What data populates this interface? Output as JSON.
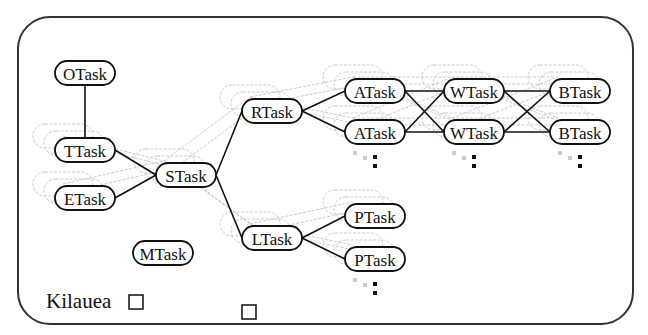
{
  "diagram": {
    "host_label": "Kilauea",
    "nodes": [
      {
        "id": "otask",
        "label": "OTask",
        "x": 85,
        "y": 73
      },
      {
        "id": "ttask",
        "label": "TTask",
        "x": 85,
        "y": 150
      },
      {
        "id": "etask",
        "label": "ETask",
        "x": 85,
        "y": 198
      },
      {
        "id": "stask",
        "label": "STask",
        "x": 186,
        "y": 175
      },
      {
        "id": "mtask",
        "label": "MTask",
        "x": 163,
        "y": 253
      },
      {
        "id": "rtask",
        "label": "RTask",
        "x": 272,
        "y": 111
      },
      {
        "id": "ltask",
        "label": "LTask",
        "x": 272,
        "y": 238
      },
      {
        "id": "atask1",
        "label": "ATask",
        "x": 375,
        "y": 91
      },
      {
        "id": "atask2",
        "label": "ATask",
        "x": 375,
        "y": 132
      },
      {
        "id": "wtask1",
        "label": "WTask",
        "x": 474,
        "y": 91
      },
      {
        "id": "wtask2",
        "label": "WTask",
        "x": 474,
        "y": 132
      },
      {
        "id": "btask1",
        "label": "BTask",
        "x": 580,
        "y": 91
      },
      {
        "id": "btask2",
        "label": "BTask",
        "x": 580,
        "y": 132
      },
      {
        "id": "ptask1",
        "label": "PTask",
        "x": 375,
        "y": 216
      },
      {
        "id": "ptask2",
        "label": "PTask",
        "x": 375,
        "y": 259
      }
    ],
    "edges": [
      [
        "otask",
        "ttask"
      ],
      [
        "ttask",
        "stask"
      ],
      [
        "etask",
        "stask"
      ],
      [
        "stask",
        "rtask"
      ],
      [
        "stask",
        "ltask"
      ],
      [
        "rtask",
        "atask1"
      ],
      [
        "rtask",
        "atask2"
      ],
      [
        "atask1",
        "wtask1"
      ],
      [
        "atask1",
        "wtask2"
      ],
      [
        "atask2",
        "wtask1"
      ],
      [
        "atask2",
        "wtask2"
      ],
      [
        "wtask1",
        "btask1"
      ],
      [
        "wtask1",
        "btask2"
      ],
      [
        "wtask2",
        "btask1"
      ],
      [
        "wtask2",
        "btask2"
      ],
      [
        "ltask",
        "ptask1"
      ],
      [
        "ltask",
        "ptask2"
      ]
    ],
    "continuation_markers": [
      "atask2",
      "wtask2",
      "btask2",
      "ptask2"
    ]
  }
}
